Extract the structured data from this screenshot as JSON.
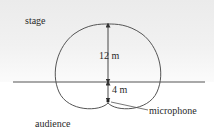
{
  "diagram": {
    "type": "cardioid-pickup-pattern",
    "regions": {
      "upper": "stage",
      "lower": "audience"
    },
    "dimensions": {
      "forward": "12 m",
      "rear": "4 m"
    },
    "callouts": {
      "mic": "microphone"
    },
    "colors": {
      "curve": "#555555",
      "baseline": "#555555",
      "stage_shade": "#ebebeb",
      "text": "#2a2a2a"
    }
  }
}
